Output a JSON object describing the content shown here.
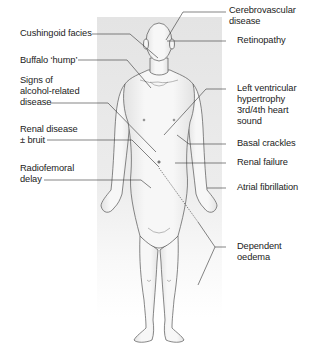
{
  "diagram": {
    "type": "annotated-anatomy-figure",
    "colors": {
      "panel": "#e6e6e6",
      "body_fill": "#f4f4f4",
      "outline": "#555555",
      "leader_line": "#333333",
      "text": "#222222"
    },
    "left_labels": [
      {
        "id": "cushingoid",
        "lines": [
          "Cushingoid facies"
        ]
      },
      {
        "id": "buffalo",
        "lines": [
          "Buffalo ‘hump’"
        ]
      },
      {
        "id": "alcohol",
        "lines": [
          "Signs of",
          "alcohol-related",
          "disease"
        ]
      },
      {
        "id": "renal-disease",
        "lines": [
          "Renal disease",
          "± bruit"
        ]
      },
      {
        "id": "radiofemoral",
        "lines": [
          "Radiofemoral",
          "delay"
        ]
      }
    ],
    "right_labels": [
      {
        "id": "cerebrovascular",
        "lines": [
          "Cerebrovascular",
          "disease"
        ]
      },
      {
        "id": "retinopathy",
        "lines": [
          "Retinopathy"
        ]
      },
      {
        "id": "lvh",
        "lines": [
          "Left ventricular",
          "hypertrophy",
          "3rd/4th heart",
          "sound"
        ]
      },
      {
        "id": "basal",
        "lines": [
          "Basal crackles"
        ]
      },
      {
        "id": "renal-failure",
        "lines": [
          "Renal failure"
        ]
      },
      {
        "id": "af",
        "lines": [
          "Atrial fibrillation"
        ]
      },
      {
        "id": "oedema",
        "lines": [
          "Dependent",
          "oedema"
        ]
      }
    ]
  }
}
